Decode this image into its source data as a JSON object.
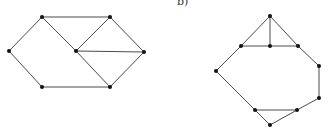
{
  "labels": {
    "b": "b)"
  },
  "colors": {
    "edge": "#4a4a4a",
    "node": "#111111",
    "background": "#ffffff"
  },
  "graphs": [
    {
      "name": "graph-a",
      "nodes": [
        {
          "id": "tl",
          "x": 42,
          "y": 17
        },
        {
          "id": "tr",
          "x": 110,
          "y": 17
        },
        {
          "id": "l",
          "x": 9,
          "y": 51
        },
        {
          "id": "c",
          "x": 76,
          "y": 51
        },
        {
          "id": "r",
          "x": 144,
          "y": 52
        },
        {
          "id": "bl",
          "x": 42,
          "y": 87
        },
        {
          "id": "br",
          "x": 110,
          "y": 87
        }
      ],
      "edges": [
        [
          "tl",
          "tr"
        ],
        [
          "tl",
          "l"
        ],
        [
          "l",
          "bl"
        ],
        [
          "bl",
          "br"
        ],
        [
          "tl",
          "c"
        ],
        [
          "c",
          "tr"
        ],
        [
          "c",
          "r"
        ],
        [
          "c",
          "br"
        ],
        [
          "tr",
          "r"
        ],
        [
          "r",
          "br"
        ]
      ]
    },
    {
      "name": "graph-b",
      "nodes": [
        {
          "id": "t",
          "x": 270,
          "y": 16
        },
        {
          "id": "ml",
          "x": 241,
          "y": 46
        },
        {
          "id": "m",
          "x": 270,
          "y": 46
        },
        {
          "id": "mr",
          "x": 298,
          "y": 46
        },
        {
          "id": "l",
          "x": 216,
          "y": 71
        },
        {
          "id": "ru",
          "x": 319,
          "y": 66
        },
        {
          "id": "rl",
          "x": 319,
          "y": 98
        },
        {
          "id": "bl",
          "x": 255,
          "y": 110
        },
        {
          "id": "br",
          "x": 297,
          "y": 110
        },
        {
          "id": "b",
          "x": 270,
          "y": 125
        }
      ],
      "edges": [
        [
          "t",
          "ml"
        ],
        [
          "t",
          "m"
        ],
        [
          "t",
          "mr"
        ],
        [
          "ml",
          "m"
        ],
        [
          "m",
          "mr"
        ],
        [
          "ml",
          "l"
        ],
        [
          "mr",
          "ru"
        ],
        [
          "ru",
          "rl"
        ],
        [
          "rl",
          "br"
        ],
        [
          "l",
          "bl"
        ],
        [
          "bl",
          "br"
        ],
        [
          "bl",
          "b"
        ],
        [
          "b",
          "br"
        ]
      ]
    }
  ]
}
